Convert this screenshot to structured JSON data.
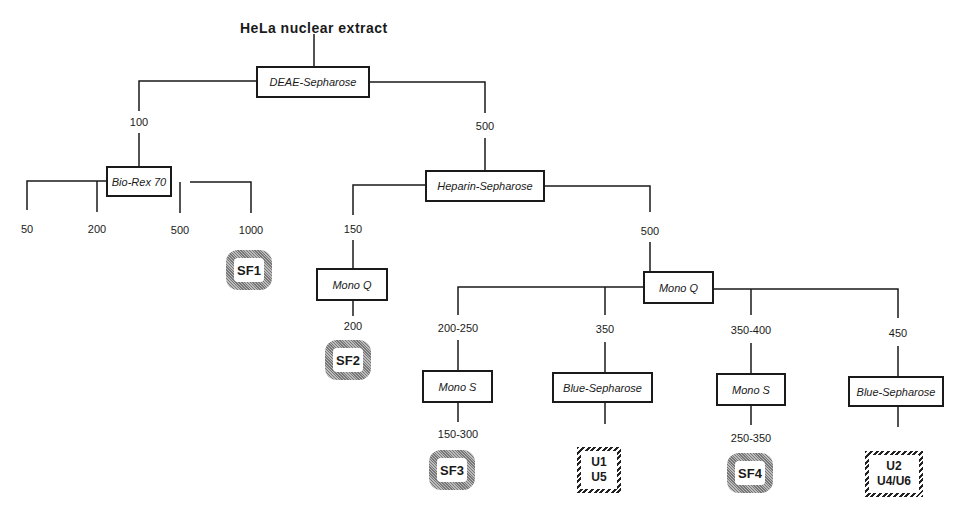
{
  "title": "HeLa nuclear extract",
  "columns": {
    "deae": "DEAE-Sepharose",
    "biorex": "Bio-Rex 70",
    "heparin": "Heparin-Sepharose",
    "monoq1": "Mono Q",
    "monoq2": "Mono Q",
    "monos1": "Mono S",
    "blue1": "Blue-Sepharose",
    "monos2": "Mono S",
    "blue2": "Blue-Sepharose"
  },
  "labels": {
    "deae_100": "100",
    "deae_500": "500",
    "biorex_50": "50",
    "biorex_200": "200",
    "biorex_500": "500",
    "biorex_1000": "1000",
    "heparin_150": "150",
    "heparin_500": "500",
    "monoq1_200": "200",
    "monoq2_200_250": "200-250",
    "monoq2_350": "350",
    "monoq2_350_400": "350-400",
    "monoq2_450": "450",
    "monos1_150_300": "150-300",
    "monos2_250_350": "250-350"
  },
  "fractions": {
    "sf1": "SF1",
    "sf2": "SF2",
    "sf3": "SF3",
    "sf4": "SF4",
    "u1_line1": "U1",
    "u1_line2": "U5",
    "u2_line1": "U2",
    "u2_line2": "U4/U6"
  }
}
